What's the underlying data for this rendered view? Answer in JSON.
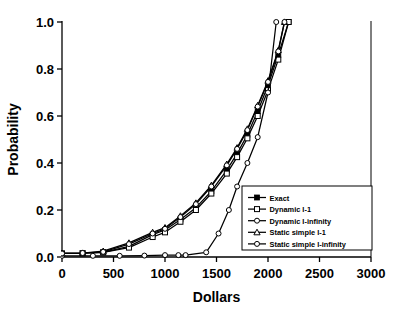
{
  "chart_data": {
    "type": "line",
    "title": "",
    "xlabel": "Dollars",
    "ylabel": "Probability",
    "xlim": [
      0,
      3000
    ],
    "ylim": [
      0.0,
      1.0
    ],
    "xticks": [
      "0",
      "500",
      "1000",
      "1500",
      "2000",
      "2500",
      "3000"
    ],
    "xtick_values": [
      0,
      500,
      1000,
      1500,
      2000,
      2500,
      3000
    ],
    "yticks": [
      "0.0",
      "0.2",
      "0.4",
      "0.6",
      "0.8",
      "1.0"
    ],
    "ytick_values": [
      0.0,
      0.2,
      0.4,
      0.6,
      0.8,
      1.0
    ],
    "grid": false,
    "legend_position": "lower-right",
    "series": [
      {
        "name": "Exact",
        "marker": "filled-square",
        "x": [
          0,
          200,
          400,
          650,
          880,
          1000,
          1150,
          1300,
          1450,
          1600,
          1700,
          1800,
          1900,
          2000,
          2100,
          2200
        ],
        "y": [
          0.015,
          0.016,
          0.02,
          0.045,
          0.095,
          0.115,
          0.16,
          0.21,
          0.28,
          0.37,
          0.44,
          0.52,
          0.62,
          0.73,
          0.86,
          1.0
        ]
      },
      {
        "name": "Dynamic I-1",
        "marker": "open-square",
        "x": [
          0,
          200,
          400,
          650,
          880,
          1000,
          1150,
          1300,
          1450,
          1600,
          1700,
          1800,
          1900,
          2000,
          2100,
          2200
        ],
        "y": [
          0.015,
          0.016,
          0.02,
          0.04,
          0.085,
          0.105,
          0.15,
          0.2,
          0.27,
          0.355,
          0.425,
          0.505,
          0.6,
          0.71,
          0.84,
          1.0
        ]
      },
      {
        "name": "Dynamic I-infinity",
        "marker": "open-circle",
        "x": [
          0,
          300,
          560,
          800,
          1000,
          1130,
          1200,
          1400,
          1520,
          1620,
          1700,
          1800,
          1900,
          2000,
          2080
        ],
        "y": [
          0.005,
          0.005,
          0.005,
          0.006,
          0.008,
          0.008,
          0.008,
          0.02,
          0.1,
          0.2,
          0.3,
          0.4,
          0.51,
          0.7,
          1.0
        ]
      },
      {
        "name": "Static simple I-1",
        "marker": "open-triangle",
        "x": [
          0,
          200,
          400,
          650,
          880,
          1000,
          1150,
          1300,
          1450,
          1600,
          1700,
          1800,
          1900,
          2000,
          2100,
          2160
        ],
        "y": [
          0.015,
          0.017,
          0.025,
          0.06,
          0.105,
          0.125,
          0.175,
          0.23,
          0.305,
          0.395,
          0.465,
          0.545,
          0.645,
          0.75,
          0.88,
          1.0
        ]
      },
      {
        "name": "Static simple I-infinity",
        "marker": "open-circle",
        "x": [
          0,
          200,
          400,
          650,
          880,
          1000,
          1150,
          1300,
          1450,
          1600,
          1700,
          1800,
          1900,
          2000,
          2100,
          2160
        ],
        "y": [
          0.015,
          0.017,
          0.022,
          0.055,
          0.1,
          0.12,
          0.17,
          0.225,
          0.3,
          0.39,
          0.46,
          0.54,
          0.64,
          0.745,
          0.875,
          1.0
        ]
      }
    ]
  },
  "legend": {
    "entries": [
      {
        "label": "Exact"
      },
      {
        "label": "Dynamic I-1"
      },
      {
        "label": "Dynamic I-infinity"
      },
      {
        "label": "Static simple I-1"
      },
      {
        "label": "Static simple I-infinity"
      }
    ]
  },
  "axes": {
    "x_title": "Dollars",
    "y_title": "Probability"
  },
  "colors": {
    "line": "#000000",
    "background": "#ffffff",
    "axis": "#000000"
  }
}
